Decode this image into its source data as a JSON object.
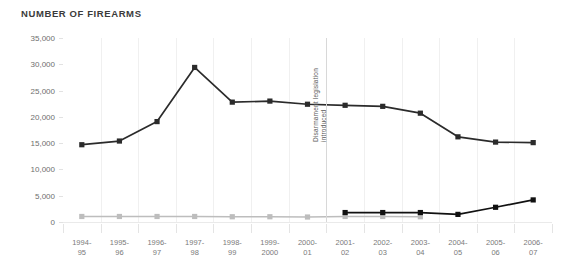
{
  "chart_data": {
    "type": "line",
    "title": "NUMBER OF FIREARMS",
    "xlabel": "",
    "ylabel": "",
    "ylim": [
      0,
      35000
    ],
    "grid": "vertical",
    "legend": "none",
    "categories": [
      "1994-95",
      "1995-96",
      "1996-97",
      "1997-98",
      "1998-99",
      "1999-2000",
      "2000-01",
      "2001-02",
      "2002-03",
      "2003-04",
      "2004-05",
      "2005-06",
      "2006-07"
    ],
    "category_lines": [
      [
        "1994-",
        "95"
      ],
      [
        "1995-",
        "96"
      ],
      [
        "1996-",
        "97"
      ],
      [
        "1997-",
        "98"
      ],
      [
        "1998-",
        "99"
      ],
      [
        "1999-",
        "2000"
      ],
      [
        "2000-",
        "01"
      ],
      [
        "2001-",
        "02"
      ],
      [
        "2002-",
        "03"
      ],
      [
        "2003-",
        "04"
      ],
      [
        "2004-",
        "05"
      ],
      [
        "2005-",
        "06"
      ],
      [
        "2006-",
        "07"
      ]
    ],
    "yticks": [
      35000,
      30000,
      25000,
      20000,
      15000,
      10000,
      5000,
      0
    ],
    "ytick_labels": [
      "35,000",
      "30,000",
      "25,000",
      "20,000",
      "15,000",
      "10,000",
      "5,000",
      "0"
    ],
    "series": [
      {
        "name": "firearms-upper",
        "color": "#2b2b2b",
        "marker": "square",
        "values": [
          14700,
          15400,
          19100,
          29400,
          22800,
          23000,
          22400,
          22200,
          22000,
          20700,
          16200,
          15200,
          15100
        ]
      },
      {
        "name": "firearms-lower-grey",
        "color": "#bdbdbd",
        "marker": "square",
        "values": [
          1050,
          1050,
          1050,
          1050,
          1000,
          1000,
          950,
          1050,
          1050,
          1000,
          null,
          null,
          null
        ]
      },
      {
        "name": "firearms-lower-black",
        "color": "#111111",
        "marker": "square",
        "values": [
          null,
          null,
          null,
          null,
          null,
          null,
          null,
          1800,
          1800,
          1800,
          1450,
          2800,
          4200
        ]
      }
    ],
    "annotations": [
      {
        "name": "disarmament-legislation-marker",
        "text": "Disarmament legislation introduced",
        "lines": [
          "Disarmament legislation",
          "introduced"
        ],
        "at_category": "2000-01",
        "orientation": "vertical"
      }
    ]
  }
}
